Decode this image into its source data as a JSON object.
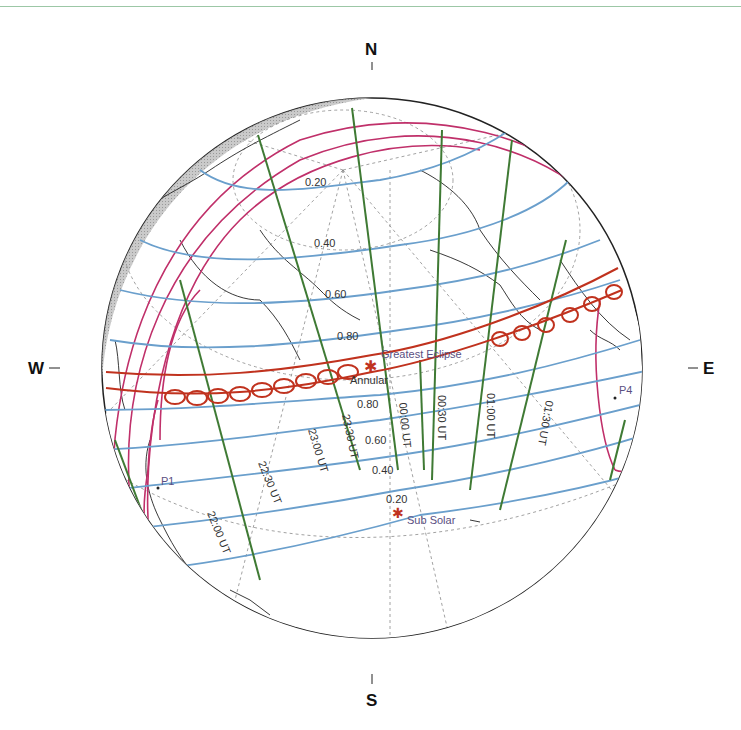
{
  "figure": {
    "type": "orthographic eclipse map",
    "eclipse_type": "Annular"
  },
  "compass": {
    "north": "N",
    "south": "S",
    "west": "W",
    "east": "E"
  },
  "markers": {
    "greatest_eclipse": "Greatest Eclipse",
    "annular": "Annular",
    "sub_solar": "Sub Solar",
    "p1": "P1",
    "p4": "P4"
  },
  "magnitude_labels": [
    "0.20",
    "0.40",
    "0.60",
    "0.80",
    "0.80",
    "0.60",
    "0.40",
    "0.20"
  ],
  "time_labels": [
    "22:00 UT",
    "22:30 UT",
    "23:00 UT",
    "23:30 UT",
    "00:00 UT",
    "00:30 UT",
    "01:00 UT",
    "01:30 UT"
  ],
  "time_labels_display": [
    "22:00 UT",
    "22:30 UT",
    "23:00 UT",
    "23:30 UT",
    "00:00 UT",
    "00:30 UT",
    "01:00 UT",
    "01:30 UT"
  ],
  "colors": {
    "magnitude_lines": "#6a9fcc",
    "time_lines": "#3f7a34",
    "penumbra_limits": "#c0306a",
    "annular_path": "#c0321e",
    "night_shade": "#b8b8b8",
    "coastlines": "#222222",
    "grid": "#888888"
  }
}
